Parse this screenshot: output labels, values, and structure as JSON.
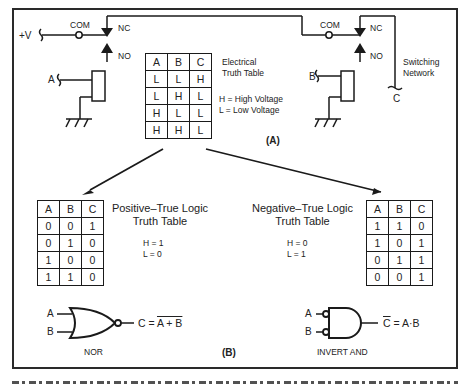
{
  "figure": {
    "part_a_label": "(A)",
    "part_b_label": "(B)",
    "caption_visible": false
  },
  "circuit": {
    "supply_label": "+V",
    "relay1": {
      "com_label": "COM",
      "nc_label": "NC",
      "no_label": "NO",
      "coil_input_label": "A"
    },
    "relay2": {
      "com_label": "COM",
      "nc_label": "NC",
      "no_label": "NO",
      "coil_input_label": "B"
    },
    "output_label": "C",
    "network_label_line1": "Switching",
    "network_label_line2": "Network"
  },
  "electrical_table": {
    "title_line1": "Electrical",
    "title_line2": "Truth Table",
    "legend_h": "H = High  Voltage",
    "legend_l": "L = Low  Voltage",
    "headers": [
      "A",
      "B",
      "C"
    ],
    "rows": [
      [
        "L",
        "L",
        "H"
      ],
      [
        "L",
        "H",
        "L"
      ],
      [
        "H",
        "L",
        "L"
      ],
      [
        "H",
        "H",
        "L"
      ]
    ]
  },
  "positive_table": {
    "title_line1": "Positive–True Logic",
    "title_line2": "Truth Table",
    "legend_h": "H = 1",
    "legend_l": "L = 0",
    "headers": [
      "A",
      "B",
      "C"
    ],
    "rows": [
      [
        "0",
        "0",
        "1"
      ],
      [
        "0",
        "1",
        "0"
      ],
      [
        "1",
        "0",
        "0"
      ],
      [
        "1",
        "1",
        "0"
      ]
    ]
  },
  "negative_table": {
    "title_line1": "Negative–True Logic",
    "title_line2": "Truth Table",
    "legend_h": "H = 0",
    "legend_l": "L = 1",
    "headers": [
      "A",
      "B",
      "C"
    ],
    "rows": [
      [
        "1",
        "1",
        "0"
      ],
      [
        "1",
        "0",
        "1"
      ],
      [
        "0",
        "1",
        "1"
      ],
      [
        "0",
        "0",
        "1"
      ]
    ]
  },
  "gates": {
    "nor": {
      "input_a": "A",
      "input_b": "B",
      "expression_prefix": "C = ",
      "expression_overlined": "A + B",
      "name": "NOR"
    },
    "invert_and": {
      "input_a": "A",
      "input_b": "B",
      "expression_overlined_prefix": "C",
      "expression_suffix": " = A·B",
      "name": "INVERT AND"
    }
  },
  "colors": {
    "ink": "#1a1a1a",
    "background": "#ffffff"
  }
}
